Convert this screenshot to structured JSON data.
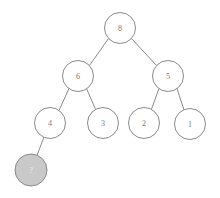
{
  "figure": {
    "type": "binary-tree-diagram",
    "width": 220,
    "height": 198,
    "background_color": "#ffffff"
  },
  "style": {
    "edge_color": "#8a8a8a",
    "node_stroke_color": "#8a8a8a",
    "node_fill_default": "#ffffff",
    "node_fill_highlight": "#c9c9c9",
    "label_color_default": "#7a7a7a",
    "label_color_highlight": "#f2f2f2",
    "node_radius": 15.5,
    "highlight_node_radius": 16
  },
  "nodes": [
    {
      "id": "n8",
      "label": "8",
      "cx": 120,
      "cy": 28,
      "r": 15.5,
      "state": "plain",
      "level": 0
    },
    {
      "id": "n6",
      "label": "6",
      "cx": 78,
      "cy": 76,
      "r": 15.5,
      "state": "plain",
      "level": 1
    },
    {
      "id": "n5",
      "label": "5",
      "cx": 168,
      "cy": 76,
      "r": 15.5,
      "state": "plain",
      "level": 1
    },
    {
      "id": "n4",
      "label": "4",
      "cx": 50,
      "cy": 123,
      "r": 15.5,
      "state": "plain",
      "level": 2
    },
    {
      "id": "n3",
      "label": "3",
      "cx": 103,
      "cy": 123,
      "r": 15.5,
      "state": "plain",
      "level": 2
    },
    {
      "id": "n2",
      "label": "2",
      "cx": 144,
      "cy": 123,
      "r": 15.5,
      "state": "plain",
      "level": 2
    },
    {
      "id": "n1",
      "label": "1",
      "cx": 190,
      "cy": 124,
      "r": 15.5,
      "state": "plain",
      "level": 2
    },
    {
      "id": "n7",
      "label": "?",
      "cx": 31,
      "cy": 170,
      "r": 16,
      "state": "highlight",
      "level": 3
    }
  ],
  "edges": [
    {
      "id": "e-8-6",
      "from": "n8",
      "to": "n6",
      "x1": 108.5,
      "y1": 38.5,
      "x2": 89.5,
      "y2": 65.5
    },
    {
      "id": "e-8-5",
      "from": "n8",
      "to": "n5",
      "x1": 131.5,
      "y1": 38.5,
      "x2": 156.5,
      "y2": 65.5
    },
    {
      "id": "e-6-4",
      "from": "n6",
      "to": "n4",
      "x1": 69.0,
      "y1": 88.5,
      "x2": 59.0,
      "y2": 110.5
    },
    {
      "id": "e-6-3",
      "from": "n6",
      "to": "n3",
      "x1": 86.5,
      "y1": 88.5,
      "x2": 96.0,
      "y2": 110.5
    },
    {
      "id": "e-5-2",
      "from": "n5",
      "to": "n2",
      "x1": 159.0,
      "y1": 88.5,
      "x2": 151.0,
      "y2": 110.5
    },
    {
      "id": "e-5-1",
      "from": "n5",
      "to": "n1",
      "x1": 177.0,
      "y1": 88.5,
      "x2": 184.5,
      "y2": 111.5
    },
    {
      "id": "e-4-7",
      "from": "n4",
      "to": "n7",
      "x1": 44.0,
      "y1": 137.0,
      "x2": 37.0,
      "y2": 155.5
    }
  ]
}
